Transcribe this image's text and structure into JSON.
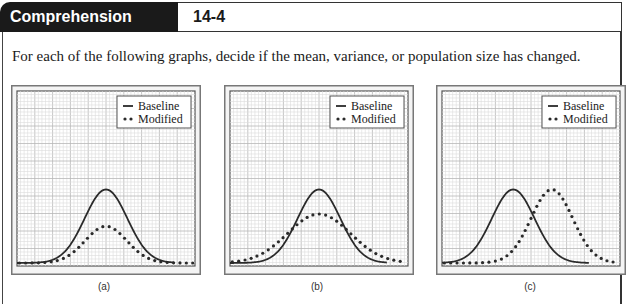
{
  "header": {
    "title": "Comprehension Check",
    "number": "14-4"
  },
  "prompt": "For each of the following graphs, decide if the mean, variance, or population size has changed.",
  "legend": {
    "baseline": "Baseline",
    "modified": "Modified"
  },
  "charts": [
    {
      "caption": "(a)"
    },
    {
      "caption": "(b)"
    },
    {
      "caption": "(c)"
    }
  ],
  "colors": {
    "header_bg": "#1a1a1a",
    "curve": "#2a2a2a",
    "grid_major": "#b8b8b8",
    "grid_minor": "#dcdcdc",
    "frame": "#777777"
  },
  "chart_data": [
    {
      "type": "line",
      "title": "(a)",
      "xlabel": "",
      "ylabel": "",
      "grid": true,
      "legend_position": "top-right",
      "note": "Same mean and variance; modified curve has smaller population (lower peak, same width).",
      "series": [
        {
          "name": "Baseline",
          "style": "solid",
          "mean": 0.5,
          "sd": 0.12,
          "peak": 0.42
        },
        {
          "name": "Modified",
          "style": "dotted",
          "mean": 0.5,
          "sd": 0.12,
          "peak": 0.21
        }
      ]
    },
    {
      "type": "line",
      "title": "(b)",
      "xlabel": "",
      "ylabel": "",
      "grid": true,
      "legend_position": "top-right",
      "note": "Same mean; modified curve has larger variance (wider, lower peak).",
      "series": [
        {
          "name": "Baseline",
          "style": "solid",
          "mean": 0.5,
          "sd": 0.12,
          "peak": 0.42
        },
        {
          "name": "Modified",
          "style": "dotted",
          "mean": 0.5,
          "sd": 0.18,
          "peak": 0.28
        }
      ]
    },
    {
      "type": "line",
      "title": "(c)",
      "xlabel": "",
      "ylabel": "",
      "grid": true,
      "legend_position": "top-right",
      "note": "Same variance and population size; modified curve has shifted (larger) mean.",
      "series": [
        {
          "name": "Baseline",
          "style": "solid",
          "mean": 0.4,
          "sd": 0.12,
          "peak": 0.42
        },
        {
          "name": "Modified",
          "style": "dotted",
          "mean": 0.62,
          "sd": 0.12,
          "peak": 0.42
        }
      ]
    }
  ]
}
